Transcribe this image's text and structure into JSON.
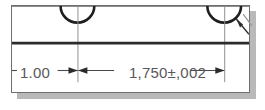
{
  "drawing": {
    "type": "engineering-dimension-detail",
    "background_color": "#ffffff",
    "frame": {
      "border_color": "#6e6e6e",
      "shadow_color": "#b9b9b9",
      "x": 11,
      "y": 5,
      "width": 239,
      "height": 88
    },
    "line_colors": {
      "object_line": "#2b2b2b",
      "thin_line": "#8a8a8a",
      "center_line": "#8a8a8a",
      "dimension_line": "#4a4a4a",
      "text": "#58585a"
    },
    "dimensions": [
      {
        "id": "dim-left",
        "label": "1.00",
        "nominal": 1.0,
        "tolerance": null,
        "units": "inch",
        "from_x": 11,
        "to_x": 77,
        "arrow_style": "outside-both"
      },
      {
        "id": "dim-right",
        "label": "1,750±,002",
        "nominal": 1.75,
        "tolerance": 0.002,
        "units": "inch",
        "from_x": 77,
        "to_x": 225,
        "arrow_style": "outside-both"
      }
    ],
    "features": [
      {
        "id": "arc-left",
        "shape": "semicircle-slot",
        "center_x": 77,
        "center_y": 6,
        "radius": 17,
        "has_centerline": true
      },
      {
        "id": "arc-right",
        "shape": "semicircle-slot",
        "center_x": 225,
        "center_y": 6,
        "radius": 17,
        "has_centerline": true,
        "has_leader": true
      }
    ],
    "object_line_y": 38
  }
}
